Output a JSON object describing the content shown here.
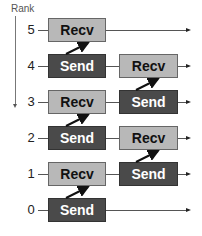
{
  "diagram": {
    "axis_label": "Rank",
    "colors": {
      "recv": "#b8b8b8",
      "send": "#4a4a4a",
      "line": "#555555"
    },
    "ranks": [
      {
        "rank": "5",
        "y": 30,
        "boxes": [
          {
            "col": 1,
            "label": "Recv",
            "type": "recv"
          }
        ]
      },
      {
        "rank": "4",
        "y": 66,
        "boxes": [
          {
            "col": 1,
            "label": "Send",
            "type": "send"
          },
          {
            "col": 2,
            "label": "Recv",
            "type": "recv"
          }
        ]
      },
      {
        "rank": "3",
        "y": 102,
        "boxes": [
          {
            "col": 1,
            "label": "Recv",
            "type": "recv"
          },
          {
            "col": 2,
            "label": "Send",
            "type": "send"
          }
        ]
      },
      {
        "rank": "2",
        "y": 138,
        "boxes": [
          {
            "col": 1,
            "label": "Send",
            "type": "send"
          },
          {
            "col": 2,
            "label": "Recv",
            "type": "recv"
          }
        ]
      },
      {
        "rank": "1",
        "y": 174,
        "boxes": [
          {
            "col": 1,
            "label": "Recv",
            "type": "recv"
          },
          {
            "col": 2,
            "label": "Send",
            "type": "send"
          }
        ]
      },
      {
        "rank": "0",
        "y": 210,
        "boxes": [
          {
            "col": 1,
            "label": "Send",
            "type": "send"
          }
        ]
      }
    ],
    "messages": [
      {
        "from_rank": "4",
        "to_rank": "5",
        "col": 1
      },
      {
        "from_rank": "2",
        "to_rank": "3",
        "col": 1
      },
      {
        "from_rank": "0",
        "to_rank": "1",
        "col": 1
      },
      {
        "from_rank": "3",
        "to_rank": "4",
        "col": 2
      },
      {
        "from_rank": "1",
        "to_rank": "2",
        "col": 2
      }
    ]
  }
}
